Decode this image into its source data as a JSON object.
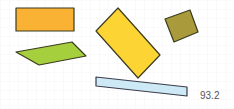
{
  "canvas": {
    "width": 234,
    "height": 109,
    "background": "#ffffff",
    "grid_color": "#eeeeee",
    "grid_step": 9
  },
  "shapes": [
    {
      "name": "orange-rectangle",
      "fill": "#f9b233",
      "stroke": "#3b3b1f",
      "points": "16,8 74,8 74,31 16,31"
    },
    {
      "name": "green-parallelogram",
      "fill": "#a5cf3c",
      "stroke": "#3b3b1f",
      "points": "16,52 72,42 86,56 39,65"
    },
    {
      "name": "yellow-rotated-rectangle",
      "fill": "#fcd535",
      "stroke": "#3b3b1f",
      "points": "96,31 118,8 160,55 138,78"
    },
    {
      "name": "olive-square",
      "fill": "#a99a3b",
      "stroke": "#3b3b1f",
      "points": "165,19 190,10 198,32 174,42"
    },
    {
      "name": "lightblue-bar",
      "fill": "#cde9f5",
      "stroke": "#3b3b4b",
      "points": "96,77 187,87 187,96 96,86"
    }
  ],
  "label": {
    "text": "93.2"
  }
}
